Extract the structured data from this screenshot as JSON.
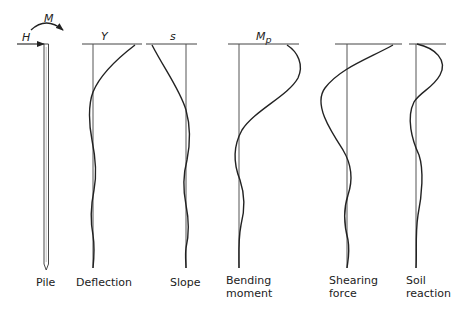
{
  "diagram": {
    "loads": {
      "horizontal_force": "H",
      "moment": "M"
    },
    "panels": [
      {
        "id": "pile",
        "label_lines": [
          "Pile"
        ],
        "top_symbol": ""
      },
      {
        "id": "deflection",
        "label_lines": [
          "Deflection"
        ],
        "top_symbol": "Y"
      },
      {
        "id": "slope",
        "label_lines": [
          "Slope"
        ],
        "top_symbol": "s"
      },
      {
        "id": "bending-moment",
        "label_lines": [
          "Bending",
          "moment"
        ],
        "top_symbol": "M",
        "top_symbol_sub": "p"
      },
      {
        "id": "shearing-force",
        "label_lines": [
          "Shearing",
          "force"
        ],
        "top_symbol": ""
      },
      {
        "id": "soil-reaction",
        "label_lines": [
          "Soil",
          "reaction"
        ],
        "top_symbol": ""
      }
    ]
  }
}
